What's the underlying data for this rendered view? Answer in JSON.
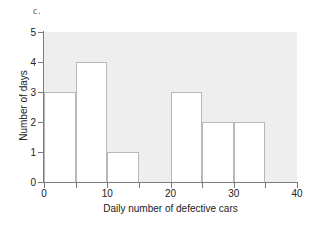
{
  "figure": {
    "part_label": "c."
  },
  "chart_data": {
    "type": "bar",
    "title": "",
    "subtitle": "",
    "xlabel": "Daily number of defective cars",
    "ylabel": "Number of days",
    "bin_width": 5,
    "bin_edges": [
      0,
      5,
      10,
      15,
      20,
      25,
      30,
      35,
      40
    ],
    "categories": [
      "0-5",
      "5-10",
      "10-15",
      "15-20",
      "20-25",
      "25-30",
      "30-35",
      "35-40"
    ],
    "values": [
      3,
      4,
      1,
      0,
      3,
      2,
      2,
      0
    ],
    "xlim": [
      0,
      40
    ],
    "ylim": [
      0,
      5
    ],
    "x_tick_labels": [
      "0",
      "10",
      "20",
      "30",
      "40"
    ],
    "x_tick_values": [
      0,
      10,
      20,
      30,
      40
    ],
    "x_minor_tick_values": [
      0,
      5,
      10,
      15,
      20,
      25,
      30,
      35,
      40
    ],
    "y_tick_labels": [
      "0",
      "1",
      "2",
      "3",
      "4",
      "5"
    ],
    "y_tick_values": [
      0,
      1,
      2,
      3,
      4,
      5
    ],
    "grid": false,
    "legend": null,
    "colors": {
      "plot_background": "#eeeeee",
      "bar_fill": "#ffffff",
      "bar_border": "#b8b8b8",
      "axis": "#7a7a7a",
      "text": "#222222",
      "canvas_background": "#ffffff"
    }
  }
}
